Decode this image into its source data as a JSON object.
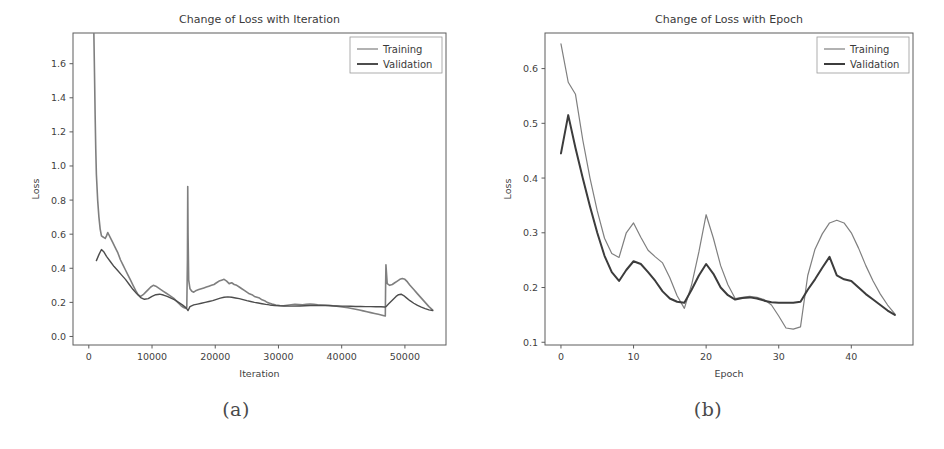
{
  "figure": {
    "panels": [
      {
        "caption": "(a)",
        "name": "panel-a"
      },
      {
        "caption": "(b)",
        "name": "panel-b"
      }
    ]
  },
  "chart_data": [
    {
      "type": "line",
      "title": "Change of Loss with Iteration",
      "xlabel": "Iteration",
      "ylabel": "Loss",
      "xlim": [
        -2500,
        56500
      ],
      "ylim": [
        -0.05,
        1.78
      ],
      "xticks": [
        0,
        10000,
        20000,
        30000,
        40000,
        50000
      ],
      "xticklabels": [
        "0",
        "10000",
        "20000",
        "30000",
        "40000",
        "50000"
      ],
      "yticks": [
        0.0,
        0.2,
        0.4,
        0.6,
        0.8,
        1.0,
        1.2,
        1.4,
        1.6
      ],
      "yticklabels": [
        "0.0",
        "0.2",
        "0.4",
        "0.6",
        "0.8",
        "1.0",
        "1.2",
        "1.4",
        "1.6"
      ],
      "grid": false,
      "legend_position": "upper right",
      "legend": [
        "Training",
        "Validation"
      ],
      "colors": {
        "training": "#7f7f7f",
        "validation": "#4d4d4d"
      },
      "series": [
        {
          "name": "Training",
          "color": "#7f7f7f",
          "linewidth": 1.6,
          "x": [
            800,
            900,
            1000,
            1100,
            1200,
            1400,
            1600,
            1800,
            2000,
            2200,
            2400,
            2600,
            2800,
            3000,
            3400,
            3800,
            4200,
            4600,
            5000,
            5400,
            5800,
            6200,
            6600,
            7000,
            7400,
            7800,
            8200,
            8600,
            9000,
            9400,
            9800,
            10200,
            10600,
            11000,
            11400,
            11800,
            12200,
            12600,
            13000,
            13400,
            13800,
            14200,
            14600,
            15000,
            15300,
            15500,
            15600,
            15650,
            15700,
            15800,
            16000,
            16300,
            16600,
            17000,
            17400,
            17800,
            18200,
            18600,
            19000,
            19400,
            19800,
            20200,
            20600,
            21000,
            21400,
            21800,
            22200,
            22600,
            23000,
            23400,
            23800,
            24200,
            24600,
            25000,
            25400,
            25800,
            26200,
            26600,
            27000,
            27400,
            27800,
            28200,
            28600,
            29000,
            29600,
            30200,
            30800,
            31400,
            32000,
            32600,
            33200,
            33800,
            34400,
            35000,
            35600,
            36200,
            36800,
            37400,
            38000,
            38600,
            39200,
            39800,
            40400,
            41000,
            41600,
            42200,
            42800,
            43400,
            44000,
            44600,
            45200,
            45800,
            46400,
            46700,
            46900,
            46950,
            47000,
            47200,
            47600,
            48000,
            48400,
            48800,
            49200,
            49600,
            50000,
            50400,
            50800,
            51400,
            52000,
            52600,
            53200,
            53800,
            54400
          ],
          "y": [
            1.78,
            1.55,
            1.3,
            1.1,
            0.95,
            0.8,
            0.7,
            0.63,
            0.59,
            0.585,
            0.58,
            0.575,
            0.59,
            0.61,
            0.58,
            0.55,
            0.52,
            0.49,
            0.45,
            0.42,
            0.39,
            0.36,
            0.33,
            0.3,
            0.27,
            0.245,
            0.235,
            0.245,
            0.26,
            0.275,
            0.29,
            0.3,
            0.295,
            0.285,
            0.275,
            0.265,
            0.255,
            0.245,
            0.235,
            0.225,
            0.21,
            0.195,
            0.18,
            0.17,
            0.165,
            0.17,
            0.45,
            0.88,
            0.6,
            0.33,
            0.28,
            0.265,
            0.26,
            0.27,
            0.275,
            0.28,
            0.285,
            0.29,
            0.295,
            0.3,
            0.305,
            0.315,
            0.325,
            0.33,
            0.335,
            0.325,
            0.31,
            0.315,
            0.305,
            0.3,
            0.29,
            0.28,
            0.27,
            0.26,
            0.25,
            0.245,
            0.235,
            0.23,
            0.225,
            0.215,
            0.21,
            0.2,
            0.195,
            0.19,
            0.185,
            0.182,
            0.18,
            0.183,
            0.186,
            0.188,
            0.187,
            0.186,
            0.188,
            0.19,
            0.188,
            0.186,
            0.185,
            0.184,
            0.183,
            0.18,
            0.178,
            0.175,
            0.172,
            0.168,
            0.164,
            0.16,
            0.155,
            0.15,
            0.145,
            0.14,
            0.135,
            0.13,
            0.125,
            0.122,
            0.12,
            0.3,
            0.42,
            0.31,
            0.3,
            0.305,
            0.315,
            0.325,
            0.335,
            0.34,
            0.335,
            0.32,
            0.3,
            0.275,
            0.25,
            0.225,
            0.2,
            0.175,
            0.155
          ]
        },
        {
          "name": "Validation",
          "color": "#4d4d4d",
          "linewidth": 1.4,
          "x": [
            1200,
            1600,
            2000,
            2400,
            2800,
            3400,
            4000,
            4600,
            5200,
            5800,
            6400,
            7000,
            7600,
            8200,
            8800,
            9400,
            10000,
            10600,
            11200,
            11800,
            12400,
            13000,
            13600,
            14200,
            14800,
            15400,
            15700,
            16000,
            16600,
            17200,
            17800,
            18400,
            19000,
            19600,
            20200,
            20800,
            21400,
            22000,
            22600,
            23200,
            23800,
            24400,
            25000,
            25600,
            26200,
            26800,
            27400,
            28000,
            28600,
            29400,
            30200,
            31000,
            31800,
            32600,
            33400,
            34200,
            35000,
            35800,
            36600,
            37400,
            38200,
            39000,
            39800,
            40600,
            41400,
            42200,
            43000,
            43800,
            44600,
            45400,
            46200,
            46800,
            47000,
            47400,
            47800,
            48200,
            48600,
            49000,
            49400,
            49800,
            50200,
            50800,
            51400,
            52000,
            52600,
            53200,
            53800,
            54400
          ],
          "y": [
            0.445,
            0.48,
            0.51,
            0.495,
            0.47,
            0.44,
            0.41,
            0.385,
            0.36,
            0.335,
            0.305,
            0.275,
            0.25,
            0.228,
            0.218,
            0.222,
            0.235,
            0.245,
            0.248,
            0.243,
            0.235,
            0.225,
            0.215,
            0.2,
            0.185,
            0.168,
            0.152,
            0.175,
            0.185,
            0.19,
            0.195,
            0.2,
            0.205,
            0.21,
            0.218,
            0.225,
            0.23,
            0.232,
            0.23,
            0.226,
            0.222,
            0.216,
            0.21,
            0.205,
            0.2,
            0.196,
            0.192,
            0.188,
            0.185,
            0.182,
            0.18,
            0.179,
            0.178,
            0.178,
            0.179,
            0.18,
            0.181,
            0.182,
            0.182,
            0.181,
            0.18,
            0.179,
            0.178,
            0.178,
            0.177,
            0.176,
            0.176,
            0.175,
            0.175,
            0.174,
            0.174,
            0.173,
            0.175,
            0.19,
            0.205,
            0.22,
            0.235,
            0.245,
            0.248,
            0.24,
            0.228,
            0.21,
            0.195,
            0.182,
            0.172,
            0.163,
            0.156,
            0.152
          ]
        }
      ]
    },
    {
      "type": "line",
      "title": "Change of Loss with Epoch",
      "xlabel": "Epoch",
      "ylabel": "Loss",
      "xlim": [
        -2.2,
        48.5
      ],
      "ylim": [
        0.095,
        0.665
      ],
      "xticks": [
        0,
        10,
        20,
        30,
        40
      ],
      "xticklabels": [
        "0",
        "10",
        "20",
        "30",
        "40"
      ],
      "yticks": [
        0.1,
        0.2,
        0.3,
        0.4,
        0.5,
        0.6
      ],
      "yticklabels": [
        "0.1",
        "0.2",
        "0.3",
        "0.4",
        "0.5",
        "0.6"
      ],
      "grid": false,
      "legend_position": "upper right",
      "legend": [
        "Training",
        "Validation"
      ],
      "colors": {
        "training": "#7f7f7f",
        "validation": "#4d4d4d"
      },
      "series": [
        {
          "name": "Training",
          "color": "#7f7f7f",
          "linewidth": 1.2,
          "x": [
            0,
            1,
            2,
            3,
            4,
            5,
            6,
            7,
            8,
            9,
            10,
            11,
            12,
            13,
            14,
            15,
            16,
            17,
            18,
            19,
            20,
            21,
            22,
            23,
            24,
            25,
            26,
            27,
            28,
            29,
            30,
            31,
            32,
            33,
            34,
            35,
            36,
            37,
            38,
            39,
            40,
            41,
            42,
            43,
            44,
            45,
            46
          ],
          "y": [
            0.645,
            0.575,
            0.553,
            0.47,
            0.4,
            0.34,
            0.29,
            0.262,
            0.255,
            0.3,
            0.318,
            0.292,
            0.268,
            0.256,
            0.245,
            0.218,
            0.185,
            0.162,
            0.205,
            0.265,
            0.333,
            0.29,
            0.24,
            0.205,
            0.18,
            0.182,
            0.184,
            0.182,
            0.178,
            0.168,
            0.148,
            0.126,
            0.124,
            0.128,
            0.222,
            0.27,
            0.298,
            0.318,
            0.323,
            0.318,
            0.3,
            0.272,
            0.24,
            0.212,
            0.188,
            0.168,
            0.152
          ]
        },
        {
          "name": "Validation",
          "color": "#3c3c3c",
          "linewidth": 2.0,
          "x": [
            0,
            1,
            2,
            3,
            4,
            5,
            6,
            7,
            8,
            9,
            10,
            11,
            12,
            13,
            14,
            15,
            16,
            17,
            18,
            19,
            20,
            21,
            22,
            23,
            24,
            25,
            26,
            27,
            28,
            29,
            30,
            31,
            32,
            33,
            34,
            35,
            36,
            37,
            38,
            39,
            40,
            41,
            42,
            43,
            44,
            45,
            46
          ],
          "y": [
            0.445,
            0.515,
            0.455,
            0.4,
            0.348,
            0.3,
            0.258,
            0.228,
            0.212,
            0.232,
            0.248,
            0.243,
            0.228,
            0.212,
            0.193,
            0.18,
            0.174,
            0.172,
            0.196,
            0.222,
            0.243,
            0.225,
            0.2,
            0.186,
            0.178,
            0.181,
            0.182,
            0.18,
            0.176,
            0.173,
            0.172,
            0.172,
            0.172,
            0.174,
            0.196,
            0.215,
            0.236,
            0.256,
            0.222,
            0.215,
            0.212,
            0.2,
            0.188,
            0.178,
            0.168,
            0.158,
            0.15
          ]
        }
      ]
    }
  ]
}
